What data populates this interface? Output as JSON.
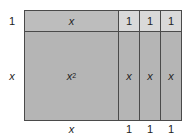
{
  "diagram": {
    "tiles": {
      "x_squared": {
        "label": "x",
        "exponent": "2"
      },
      "top_x_tile": {
        "label": "x"
      },
      "top_units": [
        "1",
        "1",
        "1"
      ],
      "right_x_tiles": [
        "x",
        "x",
        "x"
      ]
    },
    "side_labels": {
      "left_top": "1",
      "left_middle": "x",
      "bottom_left": "x",
      "bottom_units": [
        "1",
        "1",
        "1"
      ]
    },
    "colors": {
      "x_squared_fill": "#b5b5b5",
      "x_tile_fill": "#bdbdbd",
      "unit_fill": "#d9d9d9",
      "border": "#4a4a4a"
    }
  }
}
